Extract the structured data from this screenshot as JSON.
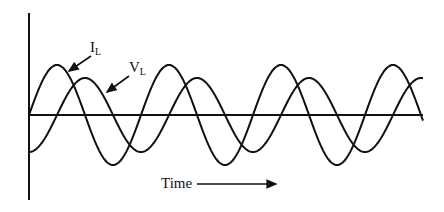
{
  "diagram": {
    "labels": {
      "current": {
        "main": "I",
        "sub": "L"
      },
      "voltage": {
        "main": "V",
        "sub": "L"
      },
      "time_axis": "Time"
    },
    "colors": {
      "stroke": "#111111",
      "background": "#ffffff"
    },
    "geometry": {
      "axis_x": 29,
      "axis_top": 13,
      "axis_bottom": 200,
      "baseline_y": 115,
      "x_end": 423,
      "period_px": 112,
      "current_amplitude": 50,
      "voltage_amplitude": 37,
      "voltage_phase_lag_quarter_periods": 1
    },
    "relationship": "Voltage and current are out of phase by a quarter period"
  }
}
